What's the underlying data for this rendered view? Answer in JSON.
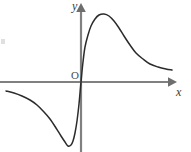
{
  "figure": {
    "width": 191,
    "height": 152,
    "background_color": "#ffffff"
  },
  "labels": {
    "y_axis": "y",
    "x_axis": "x",
    "origin": "O"
  },
  "colors": {
    "axis": "#808080",
    "curve": "#2b2b2b",
    "label_text": "#3b3b3b",
    "origin_text": "#4a4a4a",
    "background": "#ffffff"
  },
  "chart_data": {
    "type": "line",
    "title": "",
    "subtitle": "",
    "xlabel": "x",
    "ylabel": "y",
    "legend": [],
    "legend_position": "none",
    "grid": false,
    "axis_style": "cartesian-arrows",
    "origin_label": "O",
    "origin_pixel": [
      81,
      82
    ],
    "xlim": [
      -81,
      110
    ],
    "ylim": [
      -70,
      82
    ],
    "features": {
      "passes_through_origin": true,
      "symmetry": "odd",
      "left_minimum_pixel": [
        68,
        146
      ],
      "right_maximum_pixel": [
        105,
        14
      ],
      "left_tail_start_pixel": [
        6,
        91
      ],
      "right_tail_end_pixel": [
        172,
        70
      ],
      "horizontal_asymptote": "y = 0"
    },
    "series": [
      {
        "name": "curve",
        "points_pixel": [
          [
            6,
            91
          ],
          [
            14,
            93
          ],
          [
            22,
            96
          ],
          [
            30,
            100
          ],
          [
            37,
            105
          ],
          [
            44,
            112
          ],
          [
            50,
            119
          ],
          [
            56,
            128
          ],
          [
            61,
            136
          ],
          [
            65,
            142
          ],
          [
            68,
            146
          ],
          [
            71,
            145
          ],
          [
            73,
            141
          ],
          [
            75,
            133
          ],
          [
            77,
            121
          ],
          [
            79,
            104
          ],
          [
            81,
            82
          ],
          [
            83,
            62
          ],
          [
            85,
            47
          ],
          [
            88,
            35
          ],
          [
            91,
            26
          ],
          [
            95,
            19
          ],
          [
            99,
            15
          ],
          [
            104,
            14
          ],
          [
            109,
            16
          ],
          [
            114,
            21
          ],
          [
            119,
            28
          ],
          [
            124,
            36
          ],
          [
            130,
            45
          ],
          [
            136,
            53
          ],
          [
            143,
            59
          ],
          [
            150,
            64
          ],
          [
            158,
            67
          ],
          [
            166,
            69
          ],
          [
            172,
            70
          ]
        ]
      }
    ]
  },
  "axes": {
    "x_axis": {
      "start_pixel": [
        0,
        82
      ],
      "end_pixel": [
        172,
        82
      ],
      "arrow": "right"
    },
    "y_axis": {
      "start_pixel": [
        81,
        152
      ],
      "end_pixel": [
        81,
        8
      ],
      "arrow": "up"
    }
  }
}
